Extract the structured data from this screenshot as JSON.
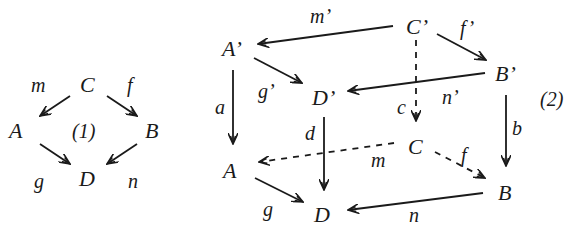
{
  "diagram1": {
    "tag": "(1)",
    "nodes": {
      "C": "C",
      "A": "A",
      "B": "B",
      "D": "D"
    },
    "edges": {
      "m": "m",
      "f": "f",
      "g": "g",
      "n": "n"
    }
  },
  "diagram2": {
    "tag": "(2)",
    "nodes": {
      "A_prime": "A’",
      "C_prime": "C’",
      "B_prime": "B’",
      "D_prime": "D’",
      "A": "A",
      "C": "C",
      "B": "B",
      "D": "D"
    },
    "edges": {
      "m_prime": "m’",
      "f_prime": "f’",
      "g_prime": "g’",
      "n_prime": "n’",
      "a": "a",
      "b": "b",
      "c": "c",
      "d": "d",
      "m": "m",
      "f": "f",
      "g": "g",
      "n": "n"
    }
  }
}
